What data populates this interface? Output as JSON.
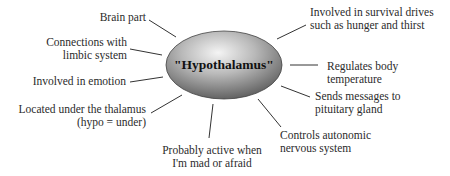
{
  "diagram": {
    "type": "concept-map",
    "center": {
      "label": "\"Hypothalamus\"",
      "shape": "ellipse",
      "fill_light": "#f2f2f2",
      "fill_dark": "#6e6e6e"
    },
    "line_color": "#333333",
    "nodes": [
      {
        "id": "brain-part",
        "lines": [
          "Brain part"
        ]
      },
      {
        "id": "connections-limbic",
        "lines": [
          "Connections with",
          "limbic system"
        ]
      },
      {
        "id": "emotion",
        "lines": [
          "Involved in emotion"
        ]
      },
      {
        "id": "under-thalamus",
        "lines": [
          "Located under the thalamus",
          "(hypo = under)"
        ]
      },
      {
        "id": "mad-afraid",
        "lines": [
          "Probably active when",
          "I'm mad or afraid"
        ]
      },
      {
        "id": "autonomic",
        "lines": [
          "Controls autonomic",
          "nervous system"
        ]
      },
      {
        "id": "pituitary",
        "lines": [
          "Sends messages to",
          "pituitary gland"
        ]
      },
      {
        "id": "temperature",
        "lines": [
          "Regulates body",
          "temperature"
        ]
      },
      {
        "id": "survival",
        "lines": [
          "Involved in survival drives",
          "such as hunger and thirst"
        ]
      }
    ]
  }
}
